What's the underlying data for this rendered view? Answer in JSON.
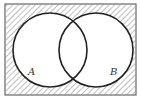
{
  "diagram": {
    "type": "venn",
    "sets": [
      {
        "label": "A",
        "cx": 50,
        "cy": 50,
        "r": 37
      },
      {
        "label": "B",
        "cx": 96,
        "cy": 50,
        "r": 37
      }
    ],
    "universe": {
      "x": 5,
      "y": 4,
      "width": 131,
      "height": 91
    },
    "shaded_region": "complement of A ∪ B",
    "colors": {
      "stroke": "#222222",
      "hatch": "#777777",
      "background": "#ffffff",
      "label": "#333333"
    }
  }
}
